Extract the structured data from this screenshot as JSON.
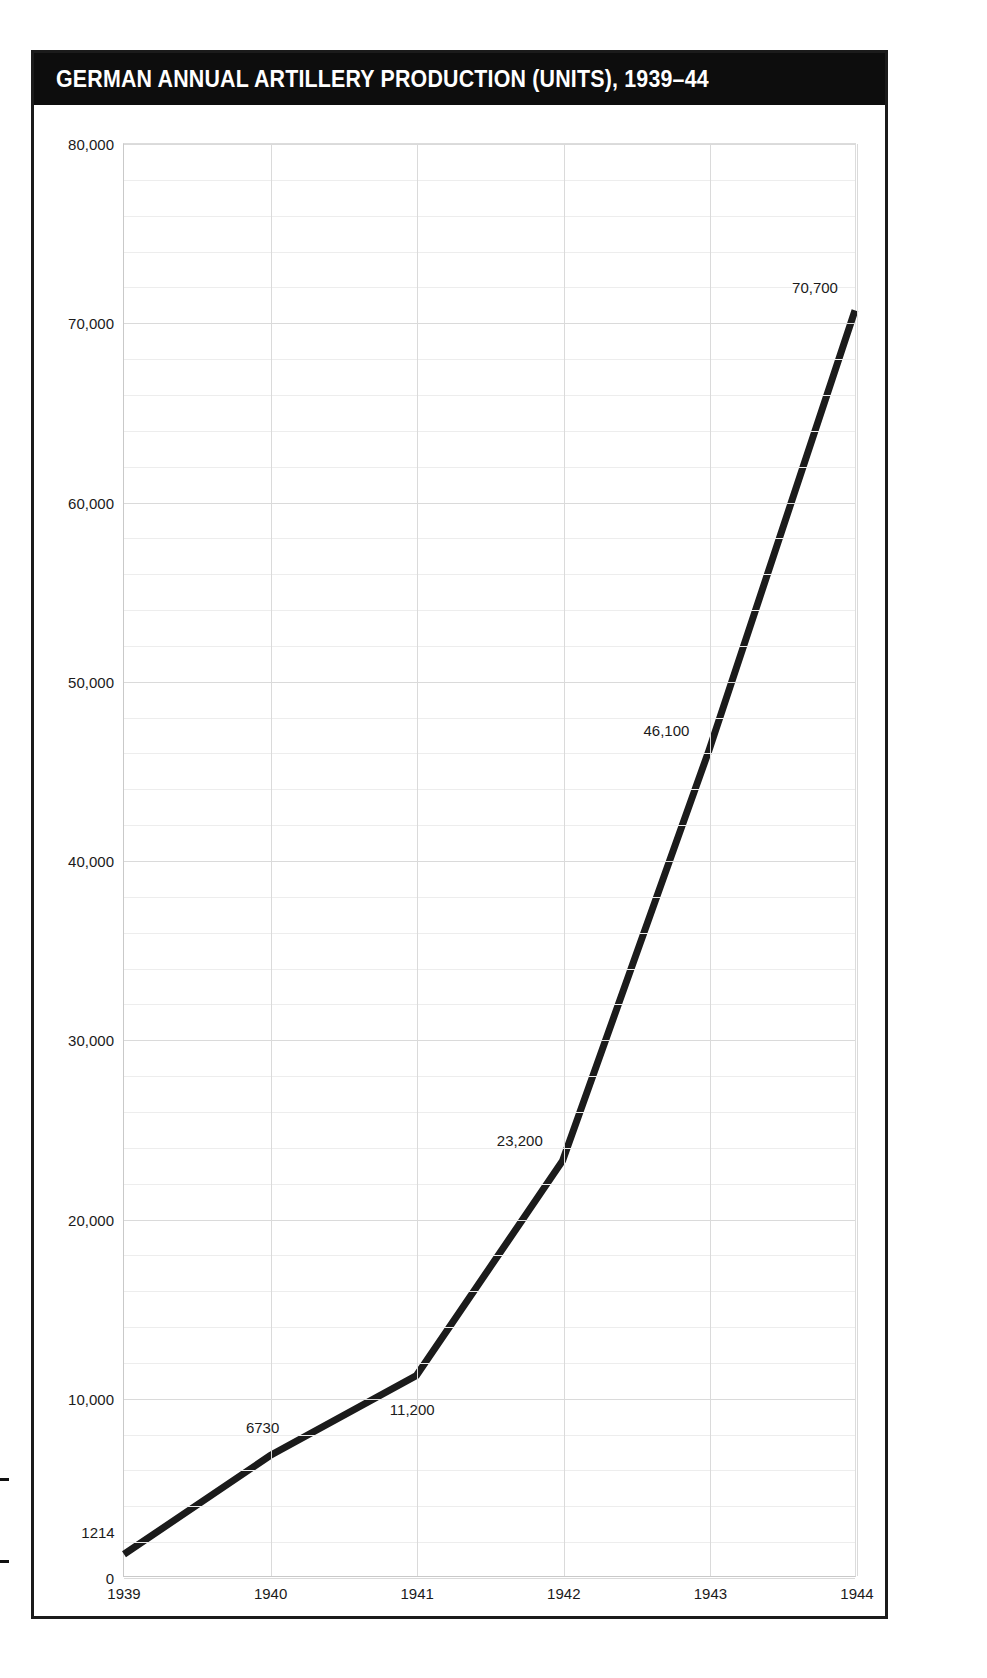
{
  "figure": {
    "title": "GERMAN ANNUAL ARTILLERY PRODUCTION (UNITS), 1939–44"
  },
  "axes": {
    "y_ticks": [
      "0",
      "10,000",
      "20,000",
      "30,000",
      "40,000",
      "50,000",
      "60,000",
      "70,000",
      "80,000"
    ],
    "x_ticks": [
      "1939",
      "1940",
      "1941",
      "1942",
      "1943",
      "1944"
    ]
  },
  "point_labels": [
    "1214",
    "6730",
    "11,200",
    "23,200",
    "46,100",
    "70,700"
  ],
  "colors": {
    "banner": "#0d0d0d",
    "banner_text": "#ffffff",
    "line": "#1b1b1b",
    "grid_major": "#dadada",
    "grid_minor": "#ededed",
    "frame": "#1b1b1b",
    "text": "#1b1b1b"
  },
  "chart_data": {
    "type": "line",
    "title": "GERMAN ANNUAL ARTILLERY PRODUCTION (UNITS), 1939–44",
    "xlabel": "",
    "ylabel": "",
    "categories": [
      "1939",
      "1940",
      "1941",
      "1942",
      "1943",
      "1944"
    ],
    "x": [
      1939,
      1940,
      1941,
      1942,
      1943,
      1944
    ],
    "values": [
      1214,
      6730,
      11200,
      23200,
      46100,
      70700
    ],
    "data_labels": [
      "1214",
      "6730",
      "11,200",
      "23,200",
      "46,100",
      "70,700"
    ],
    "ylim": [
      0,
      80000
    ],
    "ytick_values": [
      0,
      10000,
      20000,
      30000,
      40000,
      50000,
      60000,
      70000,
      80000
    ],
    "ytick_labels": [
      "0",
      "10,000",
      "20,000",
      "30,000",
      "40,000",
      "50,000",
      "60,000",
      "70,000",
      "80,000"
    ],
    "y_minor_step": 2000,
    "xlim": [
      1939,
      1944
    ],
    "grid": true,
    "legend": false,
    "series": [
      {
        "name": "Artillery units",
        "values": [
          1214,
          6730,
          11200,
          23200,
          46100,
          70700
        ]
      }
    ]
  }
}
